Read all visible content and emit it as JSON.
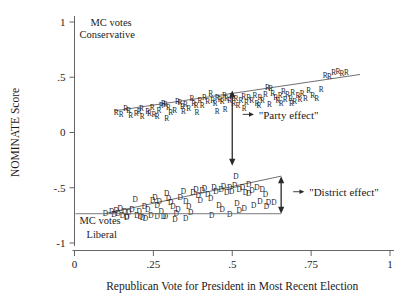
{
  "chart_data": {
    "type": "scatter",
    "title": "",
    "xlabel": "Republican Vote for President in Most Recent Election",
    "ylabel": "NOMINATE Score",
    "xlim": [
      0,
      1
    ],
    "ylim": [
      -1,
      1
    ],
    "grid": false,
    "legend": "none",
    "xticks": [
      "0",
      ".25",
      ".5",
      ".75",
      "1"
    ],
    "xtick_values": [
      0,
      0.25,
      0.5,
      0.75,
      1
    ],
    "yticks": [
      "1",
      ".5",
      "0",
      "-.5",
      "-1"
    ],
    "ytick_values": [
      1,
      0.5,
      0,
      -0.5,
      -1
    ],
    "corner_notes": {
      "top_left": [
        "MC votes",
        "Conservative"
      ],
      "bottom_left": [
        "MC votes",
        "Liberal"
      ]
    },
    "annotations": [
      {
        "label": "\"Party effect\"",
        "type": "double-arrow-vertical",
        "x": 0.5,
        "y_top": 0.38,
        "y_bottom": -0.3,
        "text_x": 0.53,
        "text_y": 0.135
      },
      {
        "label": "\"District effect\"",
        "type": "double-arrow-vertical",
        "x": 0.655,
        "y_top": -0.395,
        "y_bottom": -0.735,
        "text_x": 0.69,
        "text_y": -0.565
      }
    ],
    "reference_line": {
      "type": "horizontal",
      "y": -0.735,
      "x_start": 0.0,
      "x_end": 0.655
    },
    "series": [
      {
        "name": "Republican members of Congress",
        "marker": "R",
        "fit_line": {
          "x_start": 0.125,
          "y_start": 0.195,
          "x_end": 0.905,
          "y_end": 0.525
        },
        "points": [
          [
            0.132,
            0.185
          ],
          [
            0.148,
            0.165
          ],
          [
            0.162,
            0.215
          ],
          [
            0.178,
            0.155
          ],
          [
            0.196,
            0.175
          ],
          [
            0.212,
            0.222
          ],
          [
            0.215,
            0.145
          ],
          [
            0.232,
            0.195
          ],
          [
            0.246,
            0.232
          ],
          [
            0.252,
            0.162
          ],
          [
            0.268,
            0.205
          ],
          [
            0.282,
            0.262
          ],
          [
            0.288,
            0.255
          ],
          [
            0.298,
            0.228
          ],
          [
            0.305,
            0.182
          ],
          [
            0.318,
            0.205
          ],
          [
            0.326,
            0.285
          ],
          [
            0.334,
            0.275
          ],
          [
            0.342,
            0.235
          ],
          [
            0.352,
            0.252
          ],
          [
            0.362,
            0.222
          ],
          [
            0.372,
            0.305
          ],
          [
            0.378,
            0.265
          ],
          [
            0.386,
            0.245
          ],
          [
            0.398,
            0.288
          ],
          [
            0.405,
            0.242
          ],
          [
            0.412,
            0.318
          ],
          [
            0.422,
            0.282
          ],
          [
            0.432,
            0.352
          ],
          [
            0.438,
            0.295
          ],
          [
            0.446,
            0.262
          ],
          [
            0.452,
            0.318
          ],
          [
            0.462,
            0.302
          ],
          [
            0.468,
            0.278
          ],
          [
            0.475,
            0.335
          ],
          [
            0.482,
            0.305
          ],
          [
            0.492,
            0.288
          ],
          [
            0.498,
            0.325
          ],
          [
            0.505,
            0.268
          ],
          [
            0.512,
            0.312
          ],
          [
            0.518,
            0.245
          ],
          [
            0.528,
            0.295
          ],
          [
            0.536,
            0.332
          ],
          [
            0.545,
            0.275
          ],
          [
            0.552,
            0.318
          ],
          [
            0.562,
            0.292
          ],
          [
            0.572,
            0.338
          ],
          [
            0.578,
            0.268
          ],
          [
            0.588,
            0.322
          ],
          [
            0.596,
            0.295
          ],
          [
            0.605,
            0.345
          ],
          [
            0.612,
            0.412
          ],
          [
            0.622,
            0.398
          ],
          [
            0.628,
            0.352
          ],
          [
            0.638,
            0.318
          ],
          [
            0.645,
            0.288
          ],
          [
            0.652,
            0.335
          ],
          [
            0.662,
            0.372
          ],
          [
            0.668,
            0.298
          ],
          [
            0.675,
            0.342
          ],
          [
            0.685,
            0.312
          ],
          [
            0.692,
            0.368
          ],
          [
            0.698,
            0.285
          ],
          [
            0.708,
            0.335
          ],
          [
            0.715,
            0.298
          ],
          [
            0.722,
            0.352
          ],
          [
            0.732,
            0.312
          ],
          [
            0.742,
            0.378
          ],
          [
            0.755,
            0.335
          ],
          [
            0.768,
            0.312
          ],
          [
            0.782,
            0.395
          ],
          [
            0.795,
            0.518
          ],
          [
            0.808,
            0.505
          ],
          [
            0.822,
            0.545
          ],
          [
            0.835,
            0.555
          ],
          [
            0.848,
            0.535
          ],
          [
            0.862,
            0.548
          ],
          [
            0.262,
            0.148
          ],
          [
            0.292,
            0.132
          ],
          [
            0.345,
            0.188
          ],
          [
            0.388,
            0.182
          ],
          [
            0.452,
            0.195
          ],
          [
            0.478,
            0.212
          ],
          [
            0.538,
            0.218
          ],
          [
            0.585,
            0.242
          ],
          [
            0.618,
            0.252
          ],
          [
            0.655,
            0.262
          ],
          [
            0.688,
            0.265
          ],
          [
            0.172,
            0.202
          ],
          [
            0.205,
            0.192
          ],
          [
            0.238,
            0.175
          ],
          [
            0.275,
            0.245
          ]
        ]
      },
      {
        "name": "Democratic members of Congress",
        "marker": "D",
        "fit_line": {
          "x_start": 0.095,
          "y_start": -0.735,
          "x_end": 0.655,
          "y_end": -0.395
        },
        "points": [
          [
            0.098,
            -0.735
          ],
          [
            0.118,
            -0.715
          ],
          [
            0.125,
            -0.742
          ],
          [
            0.132,
            -0.705
          ],
          [
            0.138,
            -0.728
          ],
          [
            0.145,
            -0.688
          ],
          [
            0.152,
            -0.745
          ],
          [
            0.158,
            -0.712
          ],
          [
            0.165,
            -0.765
          ],
          [
            0.172,
            -0.725
          ],
          [
            0.182,
            -0.695
          ],
          [
            0.192,
            -0.602
          ],
          [
            0.198,
            -0.748
          ],
          [
            0.205,
            -0.715
          ],
          [
            0.215,
            -0.768
          ],
          [
            0.222,
            -0.665
          ],
          [
            0.232,
            -0.692
          ],
          [
            0.242,
            -0.745
          ],
          [
            0.248,
            -0.612
          ],
          [
            0.255,
            -0.585
          ],
          [
            0.262,
            -0.655
          ],
          [
            0.268,
            -0.622
          ],
          [
            0.275,
            -0.715
          ],
          [
            0.282,
            -0.758
          ],
          [
            0.292,
            -0.548
          ],
          [
            0.298,
            -0.592
          ],
          [
            0.305,
            -0.628
          ],
          [
            0.312,
            -0.668
          ],
          [
            0.322,
            -0.735
          ],
          [
            0.328,
            -0.698
          ],
          [
            0.335,
            -0.585
          ],
          [
            0.345,
            -0.532
          ],
          [
            0.352,
            -0.625
          ],
          [
            0.362,
            -0.672
          ],
          [
            0.368,
            -0.725
          ],
          [
            0.375,
            -0.545
          ],
          [
            0.385,
            -0.515
          ],
          [
            0.392,
            -0.572
          ],
          [
            0.398,
            -0.618
          ],
          [
            0.405,
            -0.525
          ],
          [
            0.412,
            -0.508
          ],
          [
            0.422,
            -0.562
          ],
          [
            0.432,
            -0.598
          ],
          [
            0.442,
            -0.498
          ],
          [
            0.448,
            -0.535
          ],
          [
            0.458,
            -0.655
          ],
          [
            0.465,
            -0.512
          ],
          [
            0.472,
            -0.488
          ],
          [
            0.482,
            -0.545
          ],
          [
            0.492,
            -0.495
          ],
          [
            0.498,
            -0.528
          ],
          [
            0.508,
            -0.475
          ],
          [
            0.515,
            -0.638
          ],
          [
            0.522,
            -0.512
          ],
          [
            0.532,
            -0.492
          ],
          [
            0.542,
            -0.545
          ],
          [
            0.552,
            -0.468
          ],
          [
            0.562,
            -0.522
          ],
          [
            0.568,
            -0.655
          ],
          [
            0.578,
            -0.498
          ],
          [
            0.588,
            -0.622
          ],
          [
            0.595,
            -0.515
          ],
          [
            0.605,
            -0.558
          ],
          [
            0.615,
            -0.628
          ],
          [
            0.512,
            -0.398
          ],
          [
            0.552,
            -0.552
          ],
          [
            0.318,
            -0.782
          ],
          [
            0.352,
            -0.778
          ],
          [
            0.288,
            -0.758
          ],
          [
            0.225,
            -0.772
          ],
          [
            0.165,
            -0.758
          ],
          [
            0.208,
            -0.758
          ],
          [
            0.262,
            -0.762
          ],
          [
            0.435,
            -0.745
          ],
          [
            0.468,
            -0.698
          ],
          [
            0.492,
            -0.742
          ],
          [
            0.522,
            -0.705
          ],
          [
            0.538,
            -0.682
          ],
          [
            0.608,
            -0.672
          ],
          [
            0.632,
            -0.628
          ]
        ]
      }
    ]
  }
}
